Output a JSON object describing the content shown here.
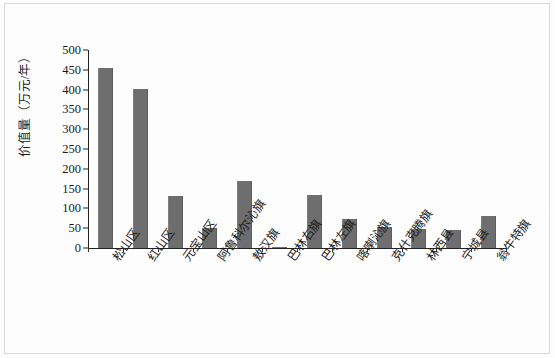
{
  "chart_data": {
    "type": "bar",
    "title": "",
    "xlabel": "",
    "ylabel": "价值量（万元/年）",
    "ylim": [
      0,
      500
    ],
    "yticks": [
      0,
      50,
      100,
      150,
      200,
      250,
      300,
      350,
      400,
      450,
      500
    ],
    "grid": false,
    "legend": null,
    "bar_color": "#6e6e6e",
    "categories": [
      "松山区",
      "红山区",
      "元宝山区",
      "阿鲁科尔沁旗",
      "敖汉旗",
      "巴林右旗",
      "巴林左旗",
      "喀喇沁旗",
      "克什克腾旗",
      "林西县",
      "宁城县",
      "翁牛特旗"
    ],
    "values": [
      455,
      402,
      132,
      51,
      170,
      3,
      135,
      73,
      52,
      48,
      45,
      82
    ]
  }
}
